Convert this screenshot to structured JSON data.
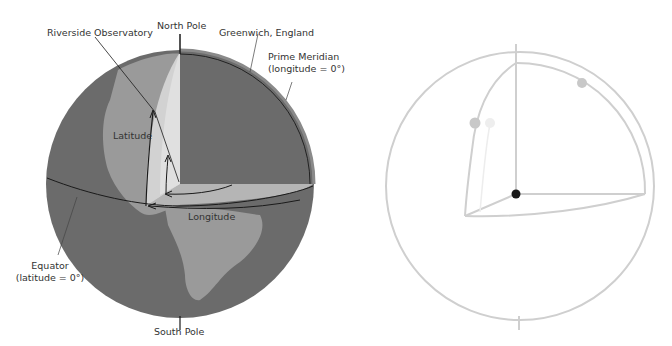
{
  "left_diagram": {
    "labels": {
      "north_pole": "North Pole",
      "riverside": "Riverside Observatory",
      "greenwich": "Greenwich, England",
      "prime_meridian_1": "Prime Meridian",
      "prime_meridian_2": "(longitude = 0°)",
      "latitude": "Latitude",
      "longitude": "Longitude",
      "equator_1": "Equator",
      "equator_2": "(latitude = 0°)",
      "south_pole": "South Pole"
    },
    "colors": {
      "ocean": "#6b6b6b",
      "land": "#9a9a9a",
      "cut_face": "#c8c8c8",
      "cut_face_light": "#dcdcdc",
      "line": "#1a1a1a"
    }
  },
  "right_diagram": {
    "colors": {
      "line": "#cfcfcf",
      "dot": "#c8c8c8",
      "center_dot": "#1a1a1a"
    }
  }
}
